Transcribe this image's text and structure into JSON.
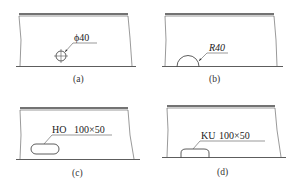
{
  "figure": {
    "panels": [
      {
        "id": "a",
        "caption": "(a)",
        "label": "ϕ40",
        "feature": "circular hole",
        "symbol": "diameter"
      },
      {
        "id": "b",
        "caption": "(b)",
        "label": "R40",
        "feature": "semicircular notch at edge",
        "symbol": "radius"
      },
      {
        "id": "c",
        "caption": "(c)",
        "label_code": "HO",
        "label_size": "100×50",
        "feature": "oblong hole"
      },
      {
        "id": "d",
        "caption": "(d)",
        "label_code": "KU",
        "label_size": "100×50",
        "feature": "oblong half-notch at edge"
      }
    ]
  },
  "colors": {
    "line": "#333333",
    "background": "#ffffff"
  }
}
